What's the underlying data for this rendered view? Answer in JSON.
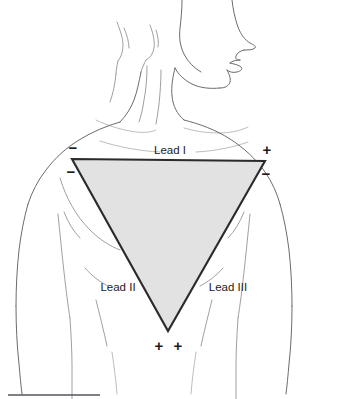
{
  "figure": {
    "name": "einthovens-triangle",
    "background_color": "#ffffff"
  },
  "triangle": {
    "fill_color": "#e2e2e2",
    "stroke_color": "#2b2b2b",
    "vertices": {
      "left": {
        "x": 72,
        "y": 159
      },
      "right": {
        "x": 265,
        "y": 161
      },
      "bottom": {
        "x": 168,
        "y": 331
      }
    }
  },
  "labels": {
    "lead_1": "Lead I",
    "lead_2": "Lead II",
    "lead_3": "Lead III"
  },
  "polarity": {
    "left_upper_minus": "−",
    "left_lower_minus": "−",
    "right_upper_plus": "+",
    "right_lower_minus": "−",
    "bottom_plus_left": "+",
    "bottom_plus_right": "+"
  },
  "footer": {
    "rule_color": "#55555c"
  }
}
